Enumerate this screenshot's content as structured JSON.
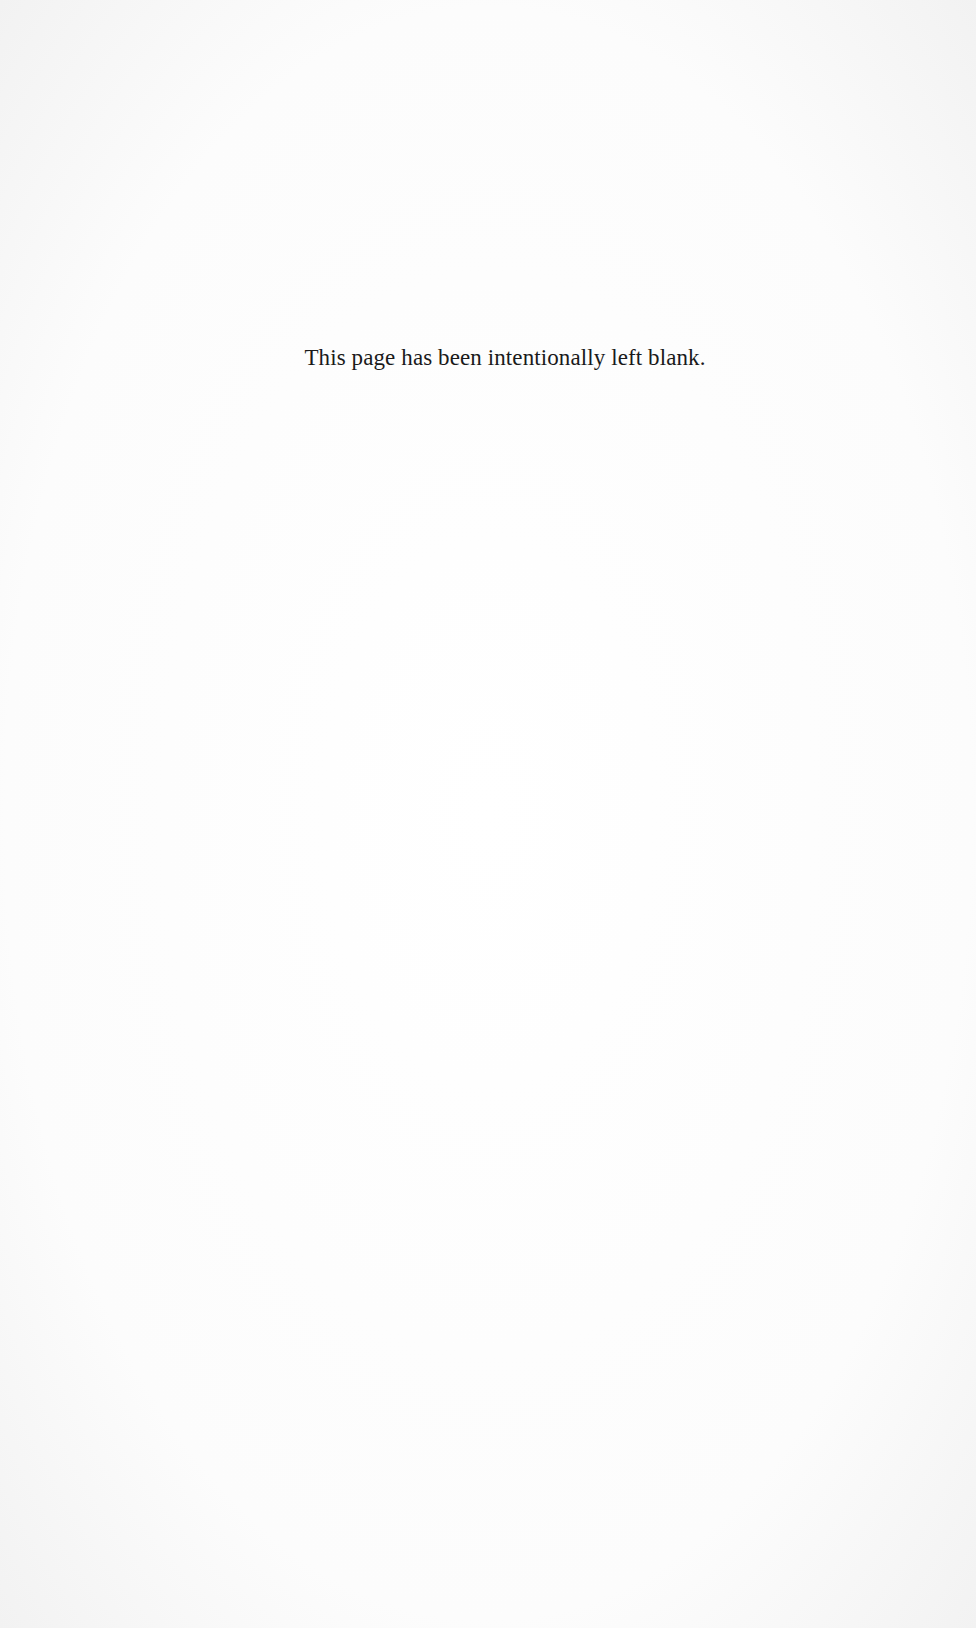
{
  "page": {
    "notice": "This page has been intentionally left blank."
  }
}
